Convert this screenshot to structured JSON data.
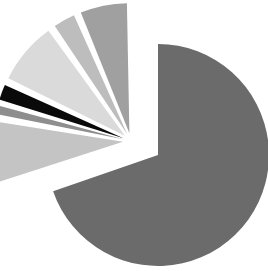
{
  "chart_data": {
    "type": "pie",
    "title": "",
    "legend": "none",
    "labels_shown": false,
    "exploded": true,
    "start_angle_deg": 0,
    "direction": "clockwise",
    "slices": [
      {
        "label": "",
        "value": 69.7,
        "color": "#6b6b6b",
        "explode": 0
      },
      {
        "label": "",
        "value": 8.1,
        "color": "#c4c4c4",
        "explode": 1
      },
      {
        "label": "",
        "value": 1.7,
        "color": "#8e8e8e",
        "explode": 1
      },
      {
        "label": "",
        "value": 2.5,
        "color": "#0a0a0a",
        "explode": 1
      },
      {
        "label": "",
        "value": 8.3,
        "color": "#dadada",
        "explode": 1
      },
      {
        "label": "",
        "value": 3.3,
        "color": "#bdbdbd",
        "explode": 1
      },
      {
        "label": "",
        "value": 6.4,
        "color": "#a0a0a0",
        "explode": 1
      }
    ]
  }
}
